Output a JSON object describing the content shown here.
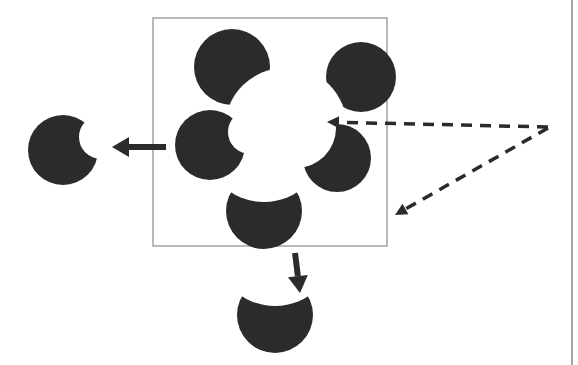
{
  "diagram": {
    "background": "#ffffff",
    "ink_color": "#2b2b2b",
    "frame_color": "#8a8a8a",
    "frame": {
      "x": 153,
      "y": 18,
      "width": 234,
      "height": 228
    },
    "right_border": {
      "x": 572,
      "y1": 0,
      "y2": 365
    },
    "center_hole": {
      "cx": 285,
      "cy": 128,
      "r": 58
    },
    "inducers": [
      {
        "id": "top",
        "cx": 232,
        "cy": 67,
        "r": 38,
        "notch": {
          "cx": 285,
          "cy": 128,
          "r": 60
        }
      },
      {
        "id": "top-right",
        "cx": 361,
        "cy": 77,
        "r": 35,
        "notch": {
          "cx": 285,
          "cy": 128,
          "r": 62
        }
      },
      {
        "id": "left",
        "cx": 210,
        "cy": 145,
        "r": 35,
        "notch": {
          "cx": 250,
          "cy": 132,
          "r": 22
        }
      },
      {
        "id": "right",
        "cx": 337,
        "cy": 158,
        "r": 34,
        "notch": {
          "cx": 296,
          "cy": 128,
          "r": 40
        }
      },
      {
        "id": "bottom",
        "cx": 264,
        "cy": 211,
        "r": 38,
        "notch": {
          "cx": 264,
          "cy": 140,
          "r": 62
        }
      }
    ],
    "extracted_shapes": [
      {
        "id": "extracted-left",
        "cx": 63,
        "cy": 150,
        "r": 35,
        "notch": {
          "cx": 101,
          "cy": 137,
          "r": 22
        }
      },
      {
        "id": "extracted-bottom",
        "cx": 275,
        "cy": 315,
        "r": 38,
        "notch": {
          "cx": 275,
          "cy": 244,
          "r": 62
        }
      }
    ],
    "solid_arrows": [
      {
        "id": "arrow-left",
        "x1": 166,
        "y1": 147,
        "x2": 112,
        "y2": 147
      },
      {
        "id": "arrow-down",
        "x1": 295,
        "y1": 253,
        "x2": 300,
        "y2": 293
      }
    ],
    "dashed_arrows": [
      {
        "id": "dashed-arrow-horizontal",
        "x1": 548,
        "y1": 127,
        "x2": 327,
        "y2": 122
      },
      {
        "id": "dashed-arrow-diagonal",
        "x1": 548,
        "y1": 128,
        "x2": 395,
        "y2": 215
      }
    ]
  }
}
